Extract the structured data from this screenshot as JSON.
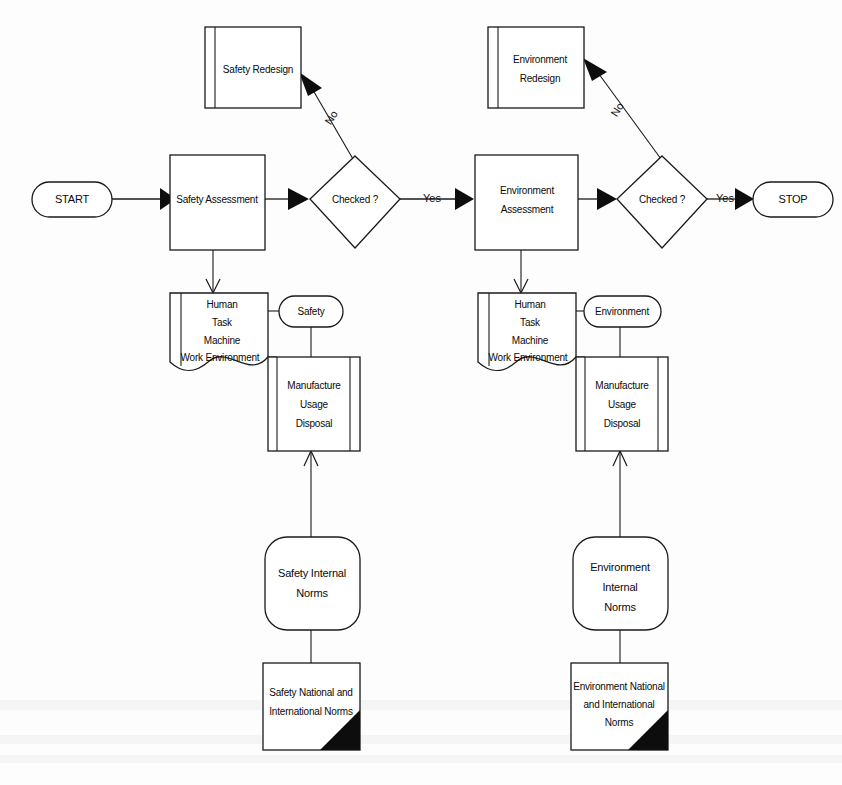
{
  "diagram": {
    "type": "flowchart",
    "orientation": "left-to-right",
    "colors": {
      "background": "#fdfdfd",
      "stroke": "#1a1a1a",
      "text": "#0a0a0a",
      "fill": "#ffffff",
      "arrow_fill": "#0d0d0d"
    }
  },
  "nodes": {
    "start": {
      "label": "START",
      "shape": "terminator"
    },
    "safety_redesign": {
      "label": "Safety Redesign",
      "shape": "predefined-process"
    },
    "safety_assessment": {
      "label": "Safety Assessment",
      "shape": "process"
    },
    "safety_checked": {
      "label": "Checked ?",
      "shape": "decision"
    },
    "safety_inputs": {
      "lines": [
        "Human",
        "Task",
        "Machine",
        "Work Environment"
      ],
      "shape": "document"
    },
    "safety_tag": {
      "label": "Safety",
      "shape": "terminator"
    },
    "safety_lifecycle": {
      "lines": [
        "Manufacture",
        "Usage",
        "Disposal"
      ],
      "shape": "process-alt"
    },
    "safety_internal_norms": {
      "lines": [
        "Safety Internal",
        "Norms"
      ],
      "shape": "rounded-rectangle"
    },
    "safety_external_norms": {
      "lines": [
        "Safety National and",
        "International Norms"
      ],
      "shape": "note"
    },
    "environment_redesign": {
      "lines": [
        "Environment",
        "Redesign"
      ],
      "shape": "predefined-process"
    },
    "environment_assessment": {
      "lines": [
        "Environment",
        "Assessment"
      ],
      "shape": "process"
    },
    "environment_checked": {
      "label": "Checked ?",
      "shape": "decision"
    },
    "environment_inputs": {
      "lines": [
        "Human",
        "Task",
        "Machine",
        "Work Environment"
      ],
      "shape": "document"
    },
    "environment_tag": {
      "label": "Environment",
      "shape": "terminator"
    },
    "environment_lifecycle": {
      "lines": [
        "Manufacture",
        "Usage",
        "Disposal"
      ],
      "shape": "process-alt"
    },
    "environment_internal_norms": {
      "lines": [
        "Environment",
        "Internal",
        "Norms"
      ],
      "shape": "rounded-rectangle"
    },
    "environment_external_norms": {
      "lines": [
        "Environment National",
        "and International",
        "Norms"
      ],
      "shape": "note"
    },
    "stop": {
      "label": "STOP",
      "shape": "terminator"
    }
  },
  "edges": {
    "safety_no": {
      "label": "No"
    },
    "safety_yes": {
      "label": "Yes"
    },
    "environment_no": {
      "label": "No"
    },
    "environment_yes": {
      "label": "Yes"
    }
  }
}
